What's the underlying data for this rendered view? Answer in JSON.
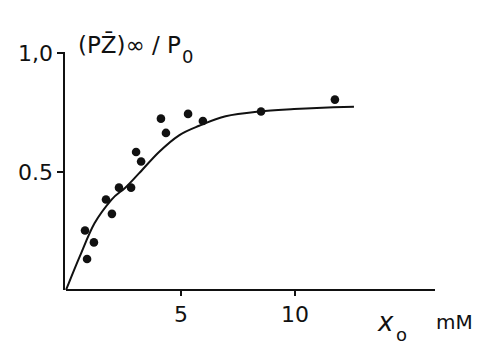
{
  "chart_data": {
    "type": "scatter",
    "title": "",
    "ylabel": "(PZ̄)∞ / P0",
    "ylabel_main": "(PZ̄)∞ / P",
    "ylabel_sub": "0",
    "xlabel": "x0 mM",
    "xlabel_symbol": "x",
    "xlabel_sub": "o",
    "xlabel_unit": "mM",
    "xlim": [
      0,
      16
    ],
    "ylim": [
      0,
      1.0
    ],
    "x_ticks": [
      5,
      10
    ],
    "x_tick_labels": [
      "5",
      "10"
    ],
    "y_ticks": [
      0.5,
      1.0
    ],
    "y_tick_labels": [
      "0.5",
      "1,0"
    ],
    "grid": false,
    "legend": null,
    "series": [
      {
        "name": "measured",
        "style": "points",
        "points": [
          {
            "x": 0.79,
            "y": 0.25
          },
          {
            "x": 0.88,
            "y": 0.13
          },
          {
            "x": 1.18,
            "y": 0.2
          },
          {
            "x": 1.71,
            "y": 0.38
          },
          {
            "x": 1.97,
            "y": 0.32
          },
          {
            "x": 2.28,
            "y": 0.43
          },
          {
            "x": 2.81,
            "y": 0.43
          },
          {
            "x": 3.03,
            "y": 0.58
          },
          {
            "x": 3.25,
            "y": 0.54
          },
          {
            "x": 4.12,
            "y": 0.72
          },
          {
            "x": 4.34,
            "y": 0.66
          },
          {
            "x": 5.31,
            "y": 0.74
          },
          {
            "x": 5.96,
            "y": 0.71
          },
          {
            "x": 8.51,
            "y": 0.75
          },
          {
            "x": 11.75,
            "y": 0.8
          }
        ]
      },
      {
        "name": "fitted curve",
        "style": "line",
        "points": [
          {
            "x": 0.0,
            "y": 0.0
          },
          {
            "x": 0.6,
            "y": 0.14
          },
          {
            "x": 1.25,
            "y": 0.28
          },
          {
            "x": 2.0,
            "y": 0.38
          },
          {
            "x": 2.6,
            "y": 0.43
          },
          {
            "x": 3.2,
            "y": 0.49
          },
          {
            "x": 4.08,
            "y": 0.58
          },
          {
            "x": 4.96,
            "y": 0.65
          },
          {
            "x": 5.84,
            "y": 0.69
          },
          {
            "x": 7.0,
            "y": 0.73
          },
          {
            "x": 8.5,
            "y": 0.75
          },
          {
            "x": 10.0,
            "y": 0.76
          },
          {
            "x": 11.0,
            "y": 0.765
          },
          {
            "x": 12.63,
            "y": 0.77
          }
        ]
      }
    ]
  }
}
